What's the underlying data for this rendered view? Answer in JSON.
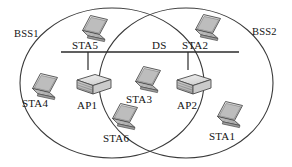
{
  "diagram": {
    "type": "network-topology",
    "colors": {
      "ellipse_stroke": "#3a3a3a",
      "device_fill": "#d8d8d8",
      "device_stroke": "#4a4a4a",
      "line": "#2b2b2b",
      "text": "#141414",
      "background": "#ffffff"
    },
    "cells": [
      {
        "id": "bss1",
        "label": "BSS1",
        "shape": "ellipse",
        "cx": 112,
        "cy": 83,
        "rx": 92,
        "ry": 75,
        "label_x": 14,
        "label_y": 28
      },
      {
        "id": "bss2",
        "label": "BSS2",
        "shape": "ellipse",
        "cx": 186,
        "cy": 83,
        "rx": 87,
        "ry": 75,
        "label_x": 252,
        "label_y": 26
      }
    ],
    "backbone": {
      "id": "ds",
      "label": "DS",
      "label_x": 152,
      "label_y": 46,
      "x1": 61,
      "x2": 239,
      "y": 52
    },
    "access_points": [
      {
        "id": "ap1",
        "label": "AP1",
        "type": "access-point",
        "x": 71,
        "y": 68,
        "label_x": 77,
        "label_y": 106,
        "link_x": 88,
        "link_y1": 52,
        "link_y2": 69
      },
      {
        "id": "ap2",
        "label": "AP2",
        "type": "access-point",
        "x": 171,
        "y": 68,
        "label_x": 177,
        "label_y": 106,
        "link_x": 188,
        "link_y1": 52,
        "link_y2": 69
      }
    ],
    "stations": [
      {
        "id": "sta5",
        "label": "STA5",
        "type": "laptop",
        "x": 77,
        "y": 14,
        "label_x": 72,
        "label_y": 46,
        "bss": "BSS1"
      },
      {
        "id": "sta4",
        "label": "STA4",
        "type": "laptop",
        "x": 27,
        "y": 72,
        "label_x": 22,
        "label_y": 104,
        "bss": "BSS1"
      },
      {
        "id": "sta6",
        "label": "STA6",
        "type": "laptop",
        "x": 107,
        "y": 102,
        "label_x": 103,
        "label_y": 139,
        "bss": "BSS1"
      },
      {
        "id": "sta3",
        "label": "STA3",
        "type": "laptop",
        "x": 130,
        "y": 65,
        "label_x": 126,
        "label_y": 100,
        "bss": "overlap"
      },
      {
        "id": "sta2",
        "label": "STA2",
        "type": "laptop",
        "x": 190,
        "y": 13,
        "label_x": 182,
        "label_y": 46,
        "bss": "BSS2"
      },
      {
        "id": "sta1",
        "label": "STA1",
        "type": "laptop",
        "x": 212,
        "y": 100,
        "label_x": 209,
        "label_y": 137,
        "bss": "BSS2"
      }
    ]
  }
}
